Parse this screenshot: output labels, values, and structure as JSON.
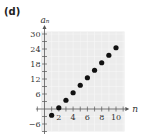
{
  "panel": {
    "label": "(d)"
  },
  "colors": {
    "background": "#ececec",
    "axis": "#555555",
    "point": "#111111"
  },
  "chart_data": {
    "type": "scatter",
    "title": "",
    "xlabel": "n",
    "ylabel": "a_n",
    "ylabel_display": "aₙ",
    "x": [
      1,
      2,
      3,
      4,
      5,
      6,
      7,
      8,
      9,
      10
    ],
    "values": [
      -2.5,
      0.5,
      3.5,
      6.5,
      9.5,
      12.5,
      15.5,
      18.5,
      21.5,
      24.5
    ],
    "xlim": [
      -1,
      11
    ],
    "ylim": [
      -8,
      32
    ],
    "x_ticks": [
      2,
      4,
      6,
      8,
      10
    ],
    "y_ticks": [
      -6,
      6,
      12,
      18,
      24,
      30
    ],
    "grid": true,
    "legend": null
  }
}
